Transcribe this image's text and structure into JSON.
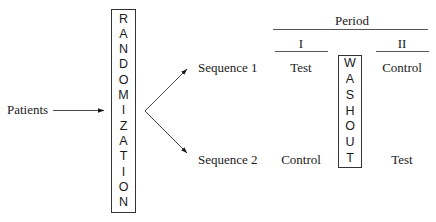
{
  "diagram": {
    "type": "crossover-design",
    "source_label": "Patients",
    "randomization": {
      "label": "RANDOMIZATION",
      "letters": [
        "R",
        "A",
        "N",
        "D",
        "O",
        "M",
        "I",
        "Z",
        "A",
        "T",
        "I",
        "O",
        "N"
      ]
    },
    "sequences": [
      {
        "label": "Sequence 1",
        "period_1": "Test",
        "period_2": "Control"
      },
      {
        "label": "Sequence 2",
        "period_1": "Control",
        "period_2": "Test"
      }
    ],
    "period_header": {
      "title": "Period",
      "periods": [
        "I",
        "II"
      ]
    },
    "washout": {
      "label": "WASHOUT",
      "letters": [
        "W",
        "A",
        "S",
        "H",
        "O",
        "U",
        "T"
      ]
    },
    "edges": [
      {
        "from": "Patients",
        "to": "RANDOMIZATION"
      },
      {
        "from": "RANDOMIZATION",
        "to": "Sequence 1"
      },
      {
        "from": "RANDOMIZATION",
        "to": "Sequence 2"
      }
    ],
    "colors": {
      "ink": "#1a1a1a",
      "background": "#ffffff"
    }
  }
}
